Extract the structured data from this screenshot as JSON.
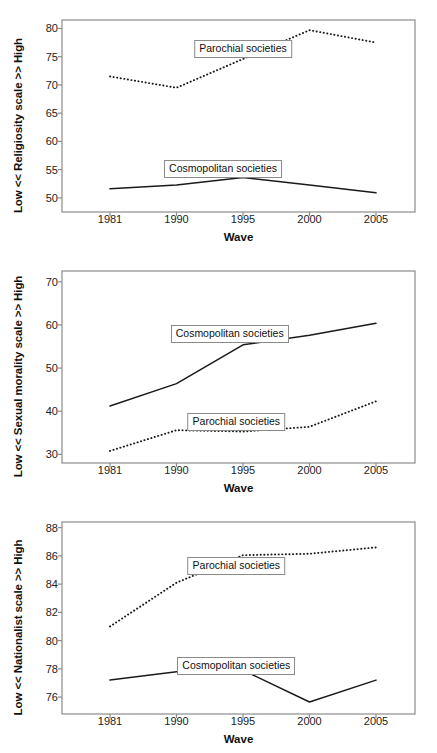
{
  "figure": {
    "background": "#ffffff",
    "line_color": "#1a1a1a",
    "frame_color": "#8c8c8c",
    "panel_count": 3
  },
  "chart_data": [
    {
      "type": "line",
      "title": "",
      "xlabel": "Wave",
      "ylabel": "Low << Religiosity scale >> High",
      "categories": [
        "1981",
        "1990",
        "1995",
        "2000",
        "2005"
      ],
      "x": [
        1981,
        1990,
        1995,
        2000,
        2005
      ],
      "ylim": [
        47.5,
        81.5
      ],
      "yticks": [
        50,
        55,
        60,
        65,
        70,
        75,
        80
      ],
      "grid": false,
      "legend_position": "inline-callout",
      "series": [
        {
          "name": "Parochial societies",
          "style": "dotted",
          "values": [
            71.5,
            69.5,
            74.6,
            79.7,
            77.5
          ],
          "label_x": 1995,
          "label_y": 76.4
        },
        {
          "name": "Cosmopolitan societies",
          "style": "solid",
          "values": [
            51.6,
            52.3,
            53.6,
            52.3,
            50.9
          ],
          "label_x": 1993.5,
          "label_y": 55.1
        }
      ]
    },
    {
      "type": "line",
      "title": "",
      "xlabel": "Wave",
      "ylabel": "Low << Sexual morality scale >> High",
      "categories": [
        "1981",
        "1990",
        "1995",
        "2000",
        "2005"
      ],
      "x": [
        1981,
        1990,
        1995,
        2000,
        2005
      ],
      "ylim": [
        28.0,
        72.5
      ],
      "yticks": [
        30,
        40,
        50,
        60,
        70
      ],
      "grid": false,
      "legend_position": "inline-callout",
      "series": [
        {
          "name": "Cosmopolitan societies",
          "style": "solid",
          "values": [
            41.2,
            46.4,
            55.4,
            57.6,
            60.4
          ],
          "label_x": 1994,
          "label_y": 57.8
        },
        {
          "name": "Parochial societies",
          "style": "dotted",
          "values": [
            30.8,
            35.6,
            35.3,
            36.4,
            42.3
          ],
          "label_x": 1994.5,
          "label_y": 37.5
        }
      ]
    },
    {
      "type": "line",
      "title": "",
      "xlabel": "Wave",
      "ylabel": "Low << Nationalist scale >> High",
      "categories": [
        "1981",
        "1990",
        "1995",
        "2000",
        "2005"
      ],
      "x": [
        1981,
        1990,
        1995,
        2000,
        2005
      ],
      "ylim": [
        74.8,
        88.4
      ],
      "yticks": [
        76,
        78,
        80,
        82,
        84,
        86,
        88
      ],
      "grid": false,
      "legend_position": "inline-callout",
      "series": [
        {
          "name": "Parochial societies",
          "style": "dotted",
          "values": [
            81.0,
            84.1,
            86.05,
            86.15,
            86.6
          ],
          "label_x": 1994.5,
          "label_y": 85.3
        },
        {
          "name": "Cosmopolitan societies",
          "style": "solid",
          "values": [
            77.2,
            77.8,
            77.9,
            75.65,
            77.2
          ],
          "label_x": 1994.5,
          "label_y": 78.2
        }
      ]
    }
  ]
}
